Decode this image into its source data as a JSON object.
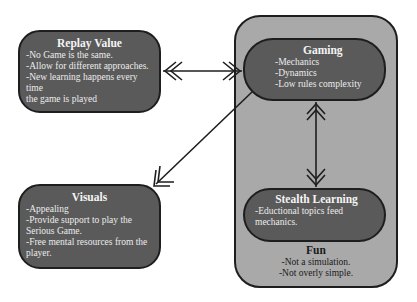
{
  "diagram": {
    "replay_value": {
      "title": "Replay Value",
      "lines": [
        "-No Game is the same.",
        "-Allow for different approaches.",
        "-New learning happens every time",
        "the game is played"
      ]
    },
    "visuals": {
      "title": "Visuals",
      "lines": [
        "-Appealing",
        "-Provide support to play the",
        "Serious Game.",
        "-Free mental resources from the",
        "player."
      ]
    },
    "gaming": {
      "title": "Gaming",
      "lines": [
        "-Mechanics",
        "-Dynamics",
        "-Low rules complexity"
      ]
    },
    "stealth_learning": {
      "title": "Stealth Learning",
      "lines": [
        "-Eductional topics feed",
        "mechanics."
      ]
    },
    "fun": {
      "title": "Fun",
      "lines": [
        "-Not a simulation.",
        "-Not overly simple."
      ]
    },
    "connections": [
      {
        "from": "Replay Value",
        "to": "Gaming",
        "type": "bidirectional"
      },
      {
        "from": "Gaming",
        "to": "Stealth Learning",
        "type": "bidirectional"
      },
      {
        "from": "Gaming",
        "to": "Visuals",
        "type": "directional"
      }
    ],
    "colors": {
      "node_fill": "#5a5a5a",
      "container_fill": "#a9a9a9",
      "stroke": "#1e1e1e"
    }
  }
}
